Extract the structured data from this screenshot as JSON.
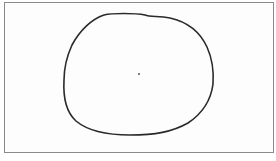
{
  "figure": {
    "frame": {
      "stroke": "#8a8a8a",
      "fill": "#fdfdfd"
    },
    "closed_curve": {
      "stroke": "#2a2a2a",
      "stroke_width": 1.6,
      "path": "M 104 15 C 112 13, 135 13, 145 15 C 150 17, 158 16, 170 18 C 188 22, 200 32, 207 47 C 212 58, 214 70, 213 84 C 211 100, 203 113, 188 123 C 172 132, 155 135, 130 135 C 108 135, 88 131, 76 121 C 66 112, 63 98, 64 80 C 64 66, 67 56, 72 45 C 80 30, 92 19, 104 15 Z"
    },
    "center_point": {
      "x": 139,
      "y": 74,
      "r": 1,
      "fill": "#555555"
    }
  }
}
